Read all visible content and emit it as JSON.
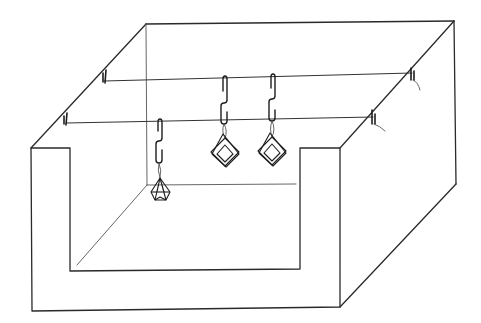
{
  "figure": {
    "colors": {
      "background": "#ffffff",
      "line": "#2a2a2a"
    },
    "tank": {
      "outer_front": {
        "x1": 31,
        "y_top": 148,
        "x2": 340,
        "y_bottom_left": 311,
        "y_bottom_right": 307
      },
      "inner_opening": {
        "x1": 70,
        "y_top": 148,
        "x2": 300,
        "y_bottom": 270
      },
      "back_top_left": [
        146,
        24
      ],
      "back_top_right": [
        454,
        21
      ],
      "right_side_bottom": [
        456,
        184
      ],
      "inner_floor_back_y": 185
    },
    "wires": [
      {
        "name": "upper-wire",
        "from": [
          104,
          81
        ],
        "to": [
          412,
          73
        ]
      },
      {
        "name": "lower-wire",
        "from": [
          66,
          123
        ],
        "to": [
          373,
          117
        ]
      }
    ],
    "clips": [
      {
        "name": "clip-upper-left",
        "x": 104,
        "y": 70
      },
      {
        "name": "clip-lower-left",
        "x": 66,
        "y": 113
      },
      {
        "name": "clip-upper-right",
        "x": 412,
        "y": 67
      },
      {
        "name": "clip-lower-right",
        "x": 373,
        "y": 110
      }
    ],
    "hangers": [
      {
        "name": "hanger-left",
        "x": 160,
        "pendant": "faceted-crystal"
      },
      {
        "name": "hanger-middle",
        "x": 225,
        "pendant": "stacked-squares"
      },
      {
        "name": "hanger-right",
        "x": 272,
        "pendant": "stacked-squares"
      }
    ]
  }
}
